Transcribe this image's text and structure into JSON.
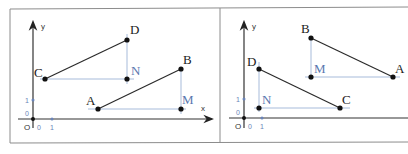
{
  "panels": [
    {
      "name": "left",
      "axes": {
        "x_label": "x",
        "y_label": "y",
        "origin_label": "O",
        "zero_x": "0",
        "zero_y": "0",
        "unit_x": "1",
        "unit_y": "1"
      },
      "points": {
        "A": {
          "label": "A"
        },
        "B": {
          "label": "B"
        },
        "C": {
          "label": "C"
        },
        "D": {
          "label": "D"
        },
        "M": {
          "label": "M"
        },
        "N": {
          "label": "N"
        }
      },
      "segments": [
        "AB",
        "CD"
      ],
      "helper_lines": [
        "AM",
        "MB",
        "CN",
        "ND"
      ]
    },
    {
      "name": "right",
      "axes": {
        "y_label": "y",
        "origin_label": "O",
        "zero_x": "0",
        "zero_y": "0",
        "unit_x": "1",
        "unit_y": "1"
      },
      "points": {
        "A": {
          "label": "A"
        },
        "B": {
          "label": "B"
        },
        "C": {
          "label": "C"
        },
        "D": {
          "label": "D"
        },
        "M": {
          "label": "M"
        },
        "N": {
          "label": "N"
        }
      },
      "segments": [
        "AB",
        "CD"
      ],
      "helper_lines": [
        "MA",
        "BM",
        "NC",
        "DN"
      ]
    }
  ],
  "colors": {
    "helper": "#9db3d6",
    "blue_label": "#5a78b0",
    "segment": "#2a2a2a"
  }
}
